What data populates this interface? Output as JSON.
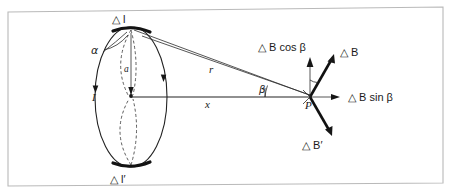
{
  "figure": {
    "frame_color": "#b9b9b9",
    "ink_color": "#1a1a1a",
    "background": "#ffffff"
  },
  "labels": {
    "delta_l_top": "△ l",
    "delta_l_bottom": "△ l′",
    "alpha": "α",
    "radius_a": "a",
    "current_I": "I",
    "distance_r": "r",
    "distance_x": "x",
    "beta_angle": "β",
    "point_P": "P",
    "delta_B": "△ B",
    "delta_B_prime": "△ B′",
    "delta_B_cos_beta": "△ B cos β",
    "delta_B_sin_beta": "△ B sin β"
  },
  "geometry": {
    "loop_center": [
      131,
      97
    ],
    "loop_rx": 36,
    "loop_ry": 70,
    "point_p": [
      310,
      97
    ],
    "top_element": [
      131,
      28
    ],
    "bottom_element": [
      131,
      166
    ],
    "x_axis_from": [
      131,
      97
    ],
    "x_axis_to": [
      310,
      97
    ],
    "beta_degrees": 21
  },
  "vectors": [
    {
      "name": "delta-B",
      "label": "△ B",
      "from": [
        310,
        97
      ],
      "to": [
        333,
        58
      ],
      "style": "solid-thick"
    },
    {
      "name": "delta-B-prime",
      "label": "△ B′",
      "from": [
        310,
        97
      ],
      "to": [
        333,
        135
      ],
      "style": "solid-thick"
    },
    {
      "name": "delta-B-cos-beta",
      "label": "△ B cos β",
      "from": [
        310,
        97
      ],
      "to": [
        310,
        58
      ],
      "style": "solid-thin"
    },
    {
      "name": "delta-B-sin-beta",
      "label": "△ B sin β",
      "from": [
        310,
        97
      ],
      "to": [
        338,
        97
      ],
      "style": "solid-thin"
    }
  ]
}
